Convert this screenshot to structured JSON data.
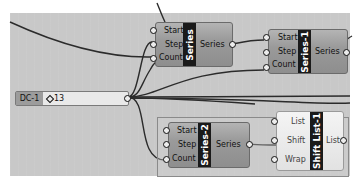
{
  "canvas": {
    "background": "#c8c8c8"
  },
  "slider": {
    "name": "DC-1",
    "value": "13"
  },
  "nodes": [
    {
      "id": "series",
      "title": "Series",
      "inputs": [
        "Start",
        "Step",
        "Count"
      ],
      "outputs": [
        "Series"
      ]
    },
    {
      "id": "series1",
      "title": "Series-1",
      "inputs": [
        "Start",
        "Step",
        "Count"
      ],
      "outputs": [
        "Series"
      ]
    },
    {
      "id": "series2",
      "title": "Series-2",
      "inputs": [
        "Start",
        "Step",
        "Count"
      ],
      "outputs": [
        "Series"
      ]
    },
    {
      "id": "shiftlist1",
      "title": "Shift List-1",
      "inputs": [
        "List",
        "Shift",
        "Wrap"
      ],
      "outputs": [
        "List"
      ]
    }
  ]
}
